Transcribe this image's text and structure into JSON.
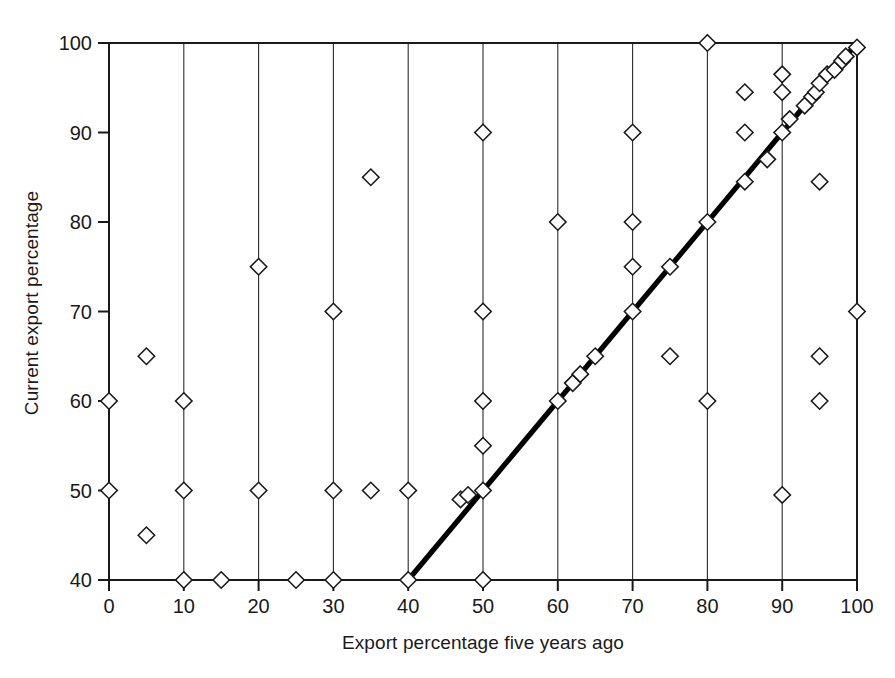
{
  "chart_data": {
    "type": "scatter",
    "title": "",
    "xlabel": "Export percentage five years ago",
    "ylabel": "Current export percentage",
    "xlim": [
      0,
      100
    ],
    "ylim": [
      40,
      100
    ],
    "xticks": [
      0,
      10,
      20,
      30,
      40,
      50,
      60,
      70,
      80,
      90,
      100
    ],
    "yticks": [
      40,
      50,
      60,
      70,
      80,
      90,
      100
    ],
    "xticklabels": [
      "0",
      "10",
      "20",
      "30",
      "40",
      "50",
      "60",
      "70",
      "80",
      "90",
      "100"
    ],
    "yticklabels": [
      "40",
      "50",
      "60",
      "70",
      "80",
      "90",
      "100"
    ],
    "grid": "vertical-only",
    "legend": "none",
    "marker": "open-diamond",
    "series": [
      {
        "name": "firms",
        "points": [
          [
            0,
            60
          ],
          [
            0,
            50
          ],
          [
            5,
            65
          ],
          [
            5,
            45
          ],
          [
            10,
            60
          ],
          [
            10,
            50
          ],
          [
            10,
            40
          ],
          [
            15,
            40
          ],
          [
            20,
            75
          ],
          [
            20,
            50
          ],
          [
            25,
            40
          ],
          [
            30,
            70
          ],
          [
            30,
            50
          ],
          [
            30,
            40
          ],
          [
            35,
            85
          ],
          [
            35,
            50
          ],
          [
            40,
            50
          ],
          [
            40,
            40
          ],
          [
            47,
            49
          ],
          [
            48,
            49.5
          ],
          [
            50,
            90
          ],
          [
            50,
            70
          ],
          [
            50,
            60
          ],
          [
            50,
            55
          ],
          [
            50,
            50
          ],
          [
            50,
            40
          ],
          [
            60,
            80
          ],
          [
            60,
            60
          ],
          [
            62,
            62
          ],
          [
            63,
            63
          ],
          [
            65,
            65
          ],
          [
            70,
            90
          ],
          [
            70,
            80
          ],
          [
            70,
            75
          ],
          [
            70,
            70
          ],
          [
            75,
            75
          ],
          [
            75,
            65
          ],
          [
            80,
            100
          ],
          [
            80,
            80
          ],
          [
            80,
            60
          ],
          [
            85,
            94.5
          ],
          [
            85,
            90
          ],
          [
            85,
            84.5
          ],
          [
            88,
            87
          ],
          [
            90,
            96.5
          ],
          [
            90,
            94.5
          ],
          [
            90,
            90
          ],
          [
            90,
            49.5
          ],
          [
            91,
            91.5
          ],
          [
            93,
            93
          ],
          [
            94,
            94
          ],
          [
            94.5,
            94.5
          ],
          [
            95,
            95.5
          ],
          [
            95,
            84.5
          ],
          [
            95,
            65
          ],
          [
            95,
            60
          ],
          [
            96,
            96.5
          ],
          [
            97,
            97
          ],
          [
            98,
            98
          ],
          [
            98.5,
            98.5
          ],
          [
            100,
            99.5
          ],
          [
            100,
            70
          ]
        ]
      }
    ],
    "trendline": {
      "name": "identity-reference-line",
      "x0": 40,
      "y0": 40,
      "x1": 100,
      "y1": 100
    },
    "colors": {
      "marker_stroke": "#1a1a1a",
      "marker_fill": "#ffffff",
      "gridline": "#2b2b2b",
      "axis": "#1a1a1a",
      "trendline": "#000000",
      "background": "#ffffff"
    }
  }
}
